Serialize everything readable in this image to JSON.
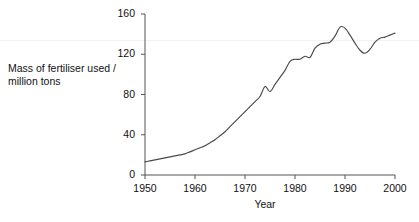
{
  "chart_data": {
    "type": "line",
    "title": "",
    "subtitle": "",
    "xlabel": "Year",
    "ylabel": "Mass of fertiliser used /\nmillion tons",
    "xlim": [
      1950,
      2000
    ],
    "ylim": [
      0,
      160
    ],
    "xticks": [
      1950,
      1960,
      1970,
      1980,
      1990,
      2000
    ],
    "xtick_labels": [
      "1950",
      "1960",
      "1970",
      "1980",
      "1990",
      "2000"
    ],
    "yticks": [
      0,
      40,
      80,
      120,
      160
    ],
    "ytick_labels": [
      "0",
      "40",
      "80",
      "120",
      "160"
    ],
    "grid": false,
    "legend": null,
    "line_color": "#4a4a4a",
    "axis_color": "#555555",
    "background": "#ffffff",
    "series": [
      {
        "name": "Mass of fertiliser used",
        "x": [
          1950,
          1951,
          1952,
          1953,
          1954,
          1955,
          1956,
          1957,
          1958,
          1959,
          1960,
          1961,
          1962,
          1963,
          1964,
          1965,
          1966,
          1967,
          1968,
          1969,
          1970,
          1971,
          1972,
          1973,
          1974,
          1975,
          1976,
          1977,
          1978,
          1979,
          1980,
          1981,
          1982,
          1983,
          1984,
          1985,
          1986,
          1987,
          1988,
          1989,
          1990,
          1991,
          1992,
          1993,
          1994,
          1995,
          1996,
          1997,
          1998,
          1999,
          2000
        ],
        "values": [
          13,
          14,
          15,
          16,
          17,
          18,
          19,
          20,
          21,
          23,
          25,
          27,
          29,
          32,
          35,
          39,
          43,
          48,
          53,
          58,
          63,
          68,
          73,
          78,
          88,
          83,
          90,
          97,
          104,
          113,
          115,
          115,
          118,
          117,
          126,
          130,
          131,
          132,
          138,
          147,
          146,
          139,
          131,
          124,
          121,
          125,
          132,
          136,
          137,
          139,
          141
        ]
      }
    ],
    "annotations": [
      {
        "label": "1974 spike",
        "x": 1974,
        "y": 88
      },
      {
        "label": "1989 peak",
        "x": 1989,
        "y": 147
      },
      {
        "label": "1994 trough",
        "x": 1994,
        "y": 121
      }
    ]
  },
  "axis_titles": {
    "y": "Mass of fertiliser used /\nmillion tons",
    "x": "Year"
  }
}
